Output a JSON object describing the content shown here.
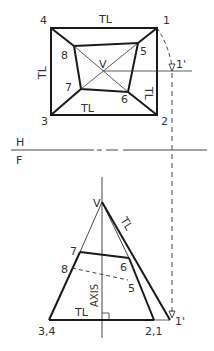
{
  "diagram": {
    "type": "orthographic-projection",
    "colors": {
      "line": "#1a1a1a",
      "thin": "#333333",
      "text": "#333333",
      "background": "#ffffff"
    },
    "top_view": {
      "labels": {
        "p4": "4",
        "p1": "1",
        "p3": "3",
        "p2": "2",
        "p8": "8",
        "p5": "5",
        "p7": "7",
        "p6": "6",
        "v": "V",
        "p1_prime": "1'",
        "tl_top": "TL",
        "tl_left": "TL",
        "tl_bottom": "TL",
        "tl_right": "TL"
      }
    },
    "fold_line": {
      "upper": "H",
      "lower": "F"
    },
    "front_view": {
      "labels": {
        "v": "V",
        "tl_edge": "TL",
        "p7": "7",
        "p6": "6",
        "p8": "8",
        "p5": "5",
        "axis": "AXIS",
        "tl_base": "TL",
        "p34": "3,4",
        "p21": "2,1",
        "p1_prime": "1'"
      }
    }
  }
}
